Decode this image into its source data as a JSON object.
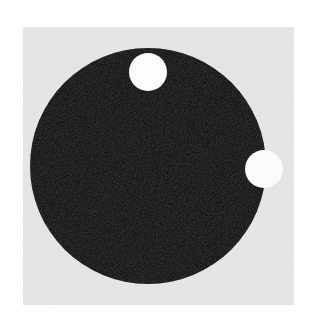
{
  "image": {
    "width": 316,
    "height": 324,
    "background_color": "#ffffff",
    "title": "Black disk with two white circular markers",
    "caption": ""
  },
  "panel": {
    "name": "image-plate",
    "x": 23,
    "y": 27,
    "width": 271,
    "height": 278,
    "fill_color": "#e7e7e7",
    "noise": true
  },
  "shapes": {
    "main_disk": {
      "label": "black-disk",
      "cx": 148,
      "cy": 166,
      "r": 118,
      "fill_color": "#0e0e0e",
      "noise": true
    },
    "markers": [
      {
        "label": "white-dot-top",
        "cx": 148,
        "cy": 72,
        "r": 19,
        "fill_color": "#fdfdfd"
      },
      {
        "label": "white-dot-right",
        "cx": 264,
        "cy": 169,
        "r": 19,
        "fill_color": "#fbfbfb"
      }
    ]
  }
}
